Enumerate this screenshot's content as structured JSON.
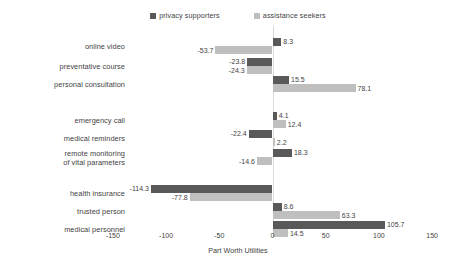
{
  "chart_data": {
    "type": "bar",
    "orientation": "horizontal",
    "title": "",
    "xlabel": "Part Worth Utilities",
    "ylabel": "",
    "xlim": [
      -150,
      150
    ],
    "xticks": [
      -150,
      -100,
      -50,
      0,
      50,
      100,
      150
    ],
    "xtick_labels": [
      "-150",
      "-100",
      "-50",
      "0",
      "50",
      "100",
      "150"
    ],
    "grid": false,
    "legend_position": "top-center",
    "categories": [
      "online video",
      "preventative course",
      "personal consultation",
      "emergency call",
      "medical reminders",
      "remote monitoring of vital parameters",
      "health insurance",
      "trusted person",
      "medical personnel"
    ],
    "groups": [
      {
        "name": "group-1",
        "categories": [
          "online video",
          "preventative course",
          "personal consultation"
        ]
      },
      {
        "name": "group-2",
        "categories": [
          "emergency call",
          "medical reminders",
          "remote monitoring of vital parameters"
        ]
      },
      {
        "name": "group-3",
        "categories": [
          "health insurance",
          "trusted person",
          "medical personnel"
        ]
      }
    ],
    "series": [
      {
        "name": "privacy supporters",
        "color": "#595959",
        "values": [
          8.3,
          -23.8,
          15.5,
          4.1,
          -22.4,
          18.3,
          -114.3,
          8.6,
          105.7
        ]
      },
      {
        "name": "assistance seekers",
        "color": "#bfbfbf",
        "values": [
          -53.7,
          -24.3,
          78.1,
          12.4,
          2.2,
          -14.6,
          -77.8,
          63.3,
          14.5
        ]
      }
    ],
    "data_labels": {
      "online video": {
        "privacy supporters": "8.3",
        "assistance seekers": "-53.7"
      },
      "preventative course": {
        "privacy supporters": "-23.8",
        "assistance seekers": "-24.3"
      },
      "personal consultation": {
        "privacy supporters": "15.5",
        "assistance seekers": "78.1"
      },
      "emergency call": {
        "privacy supporters": "4.1",
        "assistance seekers": "12.4"
      },
      "medical reminders": {
        "privacy supporters": "-22.4",
        "assistance seekers": "2.2"
      },
      "remote monitoring of vital parameters": {
        "privacy supporters": "18.3",
        "assistance seekers": "-14.6"
      },
      "health insurance": {
        "privacy supporters": "-114.3",
        "assistance seekers": "-77.8"
      },
      "trusted person": {
        "privacy supporters": "8.6",
        "assistance seekers": "63.3"
      },
      "medical personnel": {
        "privacy supporters": "105.7",
        "assistance seekers": "14.5"
      }
    }
  },
  "legend": {
    "items": [
      {
        "label": "privacy supporters",
        "color": "#595959"
      },
      {
        "label": "assistance seekers",
        "color": "#bfbfbf"
      }
    ]
  },
  "category_labels": [
    {
      "lines": [
        "online video"
      ]
    },
    {
      "lines": [
        "preventative course"
      ]
    },
    {
      "lines": [
        "personal consultation"
      ]
    },
    {
      "lines": [
        "emergency call"
      ]
    },
    {
      "lines": [
        "medical reminders"
      ]
    },
    {
      "lines": [
        "remote monitoring",
        "of vital parameters"
      ]
    },
    {
      "lines": [
        "health insurance"
      ]
    },
    {
      "lines": [
        "trusted person"
      ]
    },
    {
      "lines": [
        "medical personnel"
      ]
    }
  ],
  "axis": {
    "title": "Part Worth Utilities",
    "ticks": [
      "-150",
      "-100",
      "-50",
      "0",
      "50",
      "100",
      "150"
    ]
  }
}
